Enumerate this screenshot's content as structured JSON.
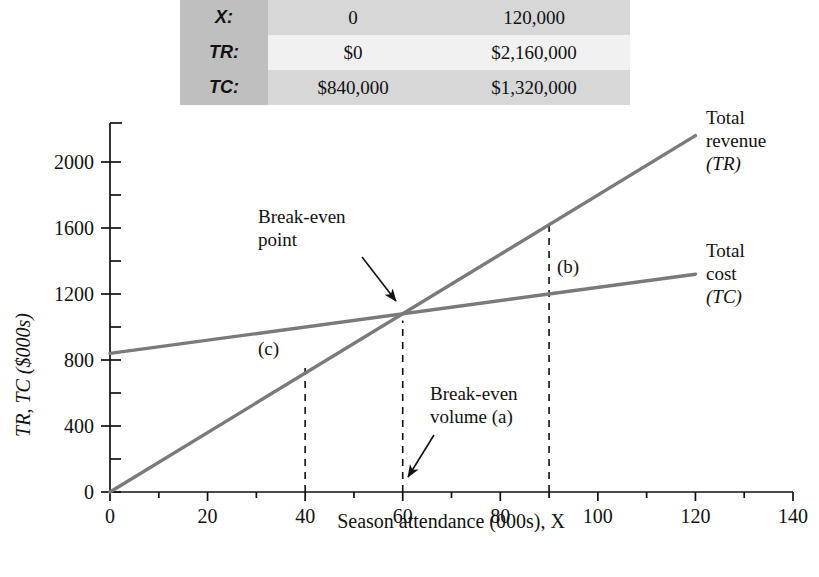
{
  "table": {
    "rows": [
      {
        "label": "X:",
        "v1": "0",
        "v2": "120,000"
      },
      {
        "label": "TR:",
        "v1": "$0",
        "v2": "$2,160,000"
      },
      {
        "label": "TC:",
        "v1": "$840,000",
        "v2": "$1,320,000"
      }
    ]
  },
  "chart_data": {
    "type": "line",
    "title": "",
    "xlabel": "Season attendance (000s), X",
    "ylabel": "TR, TC ($000s)",
    "xlim": [
      0,
      140
    ],
    "ylim": [
      0,
      2160
    ],
    "xticks": [
      "0",
      "20",
      "40",
      "60",
      "80",
      "100",
      "120",
      "140"
    ],
    "xtick_values": [
      0,
      20,
      40,
      60,
      80,
      100,
      120,
      140
    ],
    "xminor_step": 10,
    "yticks": [
      "0",
      "400",
      "800",
      "1200",
      "1600",
      "2000"
    ],
    "ytick_values": [
      0,
      400,
      800,
      1200,
      1600,
      2000
    ],
    "yminor_step": 200,
    "grid": false,
    "legend_position": "right-of-lines",
    "series": [
      {
        "name": "Total revenue (TR)",
        "label_l1": "Total",
        "label_l2": "revenue",
        "label_l3": "(TR)",
        "color": "#7a7a7a",
        "x": [
          0,
          120
        ],
        "values": [
          0,
          2160
        ]
      },
      {
        "name": "Total cost (TC)",
        "label_l1": "Total",
        "label_l2": "cost",
        "label_l3": "(TC)",
        "color": "#7a7a7a",
        "x": [
          0,
          120
        ],
        "values": [
          840,
          1320
        ]
      }
    ],
    "annotations": {
      "break_even_point": {
        "line1": "Break-even",
        "line2": "point",
        "x": 60,
        "y": 1040
      },
      "break_even_volume": {
        "line1": "Break-even",
        "line2": "volume (a)",
        "x": 60,
        "y": 0
      },
      "marker_b": {
        "text": "(b)",
        "x": 90
      },
      "marker_c": {
        "text": "(c)",
        "x": 40
      }
    },
    "reference_lines": [
      {
        "name": "(c)",
        "x": 40,
        "from_y": 0,
        "to_y": 760
      },
      {
        "name": "break-even",
        "x": 60,
        "from_y": 0,
        "to_y": 1040
      },
      {
        "name": "(b)",
        "x": 90,
        "from_y": 0,
        "to_y": 1620
      }
    ]
  }
}
